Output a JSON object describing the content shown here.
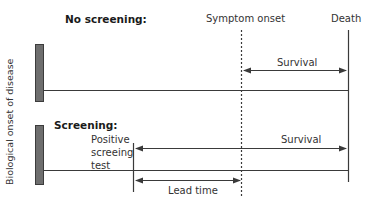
{
  "colors": {
    "bar_fill": "#6e6e6e",
    "bar_border": "#3c3c3c",
    "line": "#3a3a3a",
    "text": "#333333"
  },
  "y_axis_label": "Biological onset of disease",
  "scenarios": {
    "no_screening": {
      "label": "No screening:",
      "survival_label": "Survival"
    },
    "screening": {
      "label": "Screening:",
      "test_label_lines": [
        "Positive",
        "screeing",
        "test"
      ],
      "survival_label": "Survival",
      "lead_time_label": "Lead time"
    }
  },
  "events": {
    "symptom_onset": "Symptom onset",
    "death": "Death"
  }
}
